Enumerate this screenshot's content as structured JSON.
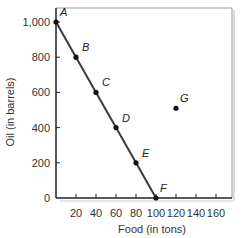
{
  "chart_data": {
    "type": "line",
    "title": "",
    "xlabel": "Food (in tons)",
    "ylabel": "Oil (in barrels)",
    "xlim": [
      0,
      170
    ],
    "ylim": [
      0,
      1050
    ],
    "x_ticks": [
      20,
      40,
      60,
      80,
      100,
      120,
      140,
      160
    ],
    "x_tick_labels": [
      "20",
      "40",
      "60",
      "80",
      "100",
      "120",
      "140",
      "160"
    ],
    "y_ticks": [
      0,
      200,
      400,
      600,
      800,
      1000
    ],
    "y_tick_labels": [
      "0",
      "200",
      "400",
      "600",
      "800",
      "1,000"
    ],
    "grid": false,
    "legend": null,
    "series": [
      {
        "name": "Production possibilities frontier",
        "x": [
          0,
          20,
          40,
          60,
          80,
          100
        ],
        "y": [
          1000,
          800,
          600,
          400,
          200,
          0
        ],
        "labels": [
          "A",
          "B",
          "C",
          "D",
          "E",
          "F"
        ]
      },
      {
        "name": "Point G",
        "x": [
          120
        ],
        "y": [
          510
        ],
        "labels": [
          "G"
        ]
      }
    ],
    "points": [
      {
        "label": "A",
        "food": 0,
        "oil": 1000
      },
      {
        "label": "B",
        "food": 20,
        "oil": 800
      },
      {
        "label": "C",
        "food": 40,
        "oil": 600
      },
      {
        "label": "D",
        "food": 60,
        "oil": 400
      },
      {
        "label": "E",
        "food": 80,
        "oil": 200
      },
      {
        "label": "F",
        "food": 100,
        "oil": 0
      },
      {
        "label": "G",
        "food": 120,
        "oil": 510
      }
    ],
    "colors": {
      "line": "#3a3a3a",
      "points": "#111111",
      "frame": "#999999",
      "axes": "#222222"
    }
  }
}
